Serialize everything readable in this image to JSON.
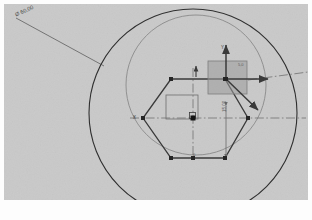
{
  "app": {
    "kind": "cad-sketch-viewport",
    "background_color": "#c9c9c9",
    "paper_color": "#fdfdfd"
  },
  "viewport": {
    "x": 4,
    "y": 4,
    "width": 304,
    "height": 196
  },
  "annotations": {
    "callout": {
      "text": "Ø 60,00",
      "x": 14,
      "y": 12,
      "rotation": -24,
      "leader": {
        "x1": 16,
        "y1": 18,
        "x2": 104,
        "y2": 66
      }
    },
    "axis_x_label": {
      "text": "X",
      "x": 133,
      "y": 115
    },
    "axis_y_label": {
      "text": "Y",
      "x": 221,
      "y": 45
    },
    "dim_vertical": {
      "text": "15,00",
      "x": 222,
      "y": 112
    },
    "dim_small": {
      "text": "5,0",
      "x": 238,
      "y": 62
    },
    "origin_label": {
      "text": "0",
      "x": 193,
      "y": 152
    }
  },
  "geometry": {
    "outer_circle": {
      "cx": 193,
      "cy": 113,
      "r": 104,
      "color": "#2f2f2f",
      "width": 1.1
    },
    "construction_circle": {
      "cx": 196,
      "cy": 85,
      "r": 70,
      "color": "#8a8a8a",
      "width": 0.9
    },
    "hexagon": {
      "color": "#3a3a3a",
      "width": 1.3,
      "points": [
        {
          "x": 171,
          "y": 79
        },
        {
          "x": 225,
          "y": 79
        },
        {
          "x": 248,
          "y": 118
        },
        {
          "x": 225,
          "y": 158
        },
        {
          "x": 171,
          "y": 158
        },
        {
          "x": 143,
          "y": 118
        }
      ]
    },
    "shaded_square": {
      "x": 208,
      "y": 61,
      "width": 39,
      "height": 33,
      "fill": "#9a9a9a",
      "fill_opacity": 0.55,
      "stroke": "#7d7d7d"
    },
    "inner_rect": {
      "x": 166,
      "y": 95,
      "width": 32,
      "height": 24,
      "stroke": "#6e6e6e"
    },
    "centerline_horizontal": {
      "x1": 130,
      "y1": 118,
      "x2": 306,
      "y2": 118,
      "color": "#6b6b6b"
    },
    "centerline_vertical": {
      "x1": 193,
      "y1": 68,
      "x2": 193,
      "y2": 160,
      "color": "#6b6b6b"
    },
    "centerline_oblique": {
      "x1": 248,
      "y1": 80,
      "x2": 308,
      "y2": 72,
      "color": "#6b6b6b"
    },
    "axis_arrow_vertical": {
      "x1": 226,
      "y1": 79,
      "x2": 226,
      "y2": 45,
      "color": "#3a3a3a"
    },
    "axis_arrow_horizontal": {
      "x1": 226,
      "y1": 79,
      "x2": 268,
      "y2": 79,
      "color": "#3a3a3a"
    },
    "axis_arrow_diagonal": {
      "x1": 226,
      "y1": 79,
      "x2": 258,
      "y2": 110,
      "color": "#3a3a3a"
    },
    "small_arrow_up": {
      "x1": 196,
      "y1": 77,
      "x2": 196,
      "y2": 66,
      "color": "#3a3a3a"
    },
    "dim_line_vertical": {
      "x1": 226,
      "y1": 106,
      "x2": 226,
      "y2": 158,
      "color": "#6b6b6b"
    },
    "vertices": [
      {
        "x": 171,
        "y": 79
      },
      {
        "x": 225,
        "y": 79
      },
      {
        "x": 248,
        "y": 118
      },
      {
        "x": 225,
        "y": 158
      },
      {
        "x": 171,
        "y": 158
      },
      {
        "x": 143,
        "y": 118
      },
      {
        "x": 193,
        "y": 118
      },
      {
        "x": 193,
        "y": 158
      },
      {
        "x": 226,
        "y": 79
      }
    ],
    "origin_marker": {
      "x": 193,
      "y": 118
    }
  }
}
